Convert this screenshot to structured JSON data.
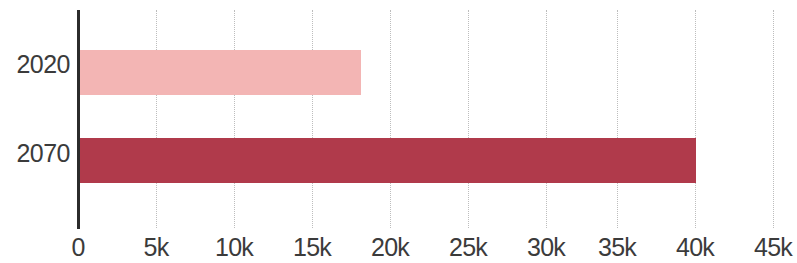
{
  "chart_data": {
    "type": "bar",
    "orientation": "horizontal",
    "title": "",
    "subtitle": "",
    "xlabel": "",
    "ylabel": "",
    "categories": [
      "2020",
      "2070"
    ],
    "values": [
      18300,
      40000
    ],
    "series": [
      {
        "name": "",
        "values": [
          18300,
          40000
        ]
      }
    ],
    "tick_values": [
      0,
      5000,
      10000,
      15000,
      20000,
      25000,
      30000,
      35000,
      40000,
      45000
    ],
    "tick_labels": [
      "0",
      "5k",
      "10k",
      "15k",
      "20k",
      "25k",
      "30k",
      "35k",
      "40k",
      "45k"
    ],
    "xlim": [
      0,
      45000
    ],
    "grid": true,
    "grid_style": "dotted",
    "legend": false,
    "legend_position": "none",
    "bar_colors": [
      "#f3b5b4",
      "#b03a4b"
    ],
    "colors": {
      "bar_2020": "#f3b5b4",
      "bar_2070": "#b03a4b",
      "axis": "#2b2b2b",
      "gridline": "#bdbdbd",
      "text": "#3b3b3b",
      "background": "#ffffff"
    }
  },
  "axis": {
    "category_labels": [
      {
        "label": "2020"
      },
      {
        "label": "2070"
      }
    ],
    "value_ticks": [
      {
        "label": "0"
      },
      {
        "label": "5k"
      },
      {
        "label": "10k"
      },
      {
        "label": "15k"
      },
      {
        "label": "20k"
      },
      {
        "label": "25k"
      },
      {
        "label": "30k"
      },
      {
        "label": "35k"
      },
      {
        "label": "40k"
      },
      {
        "label": "45k"
      }
    ]
  }
}
